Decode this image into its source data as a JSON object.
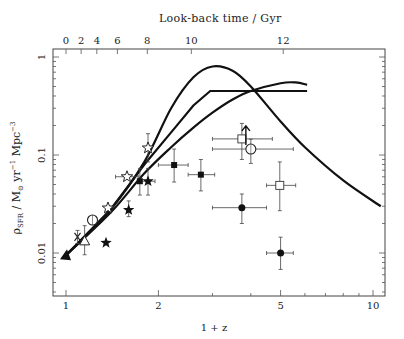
{
  "chart_data": {
    "type": "scatter",
    "title": "",
    "xlabel": "1 + z",
    "ylabel": "ρ_SFR / M⊙ yr⁻¹ Mpc⁻³",
    "x_scale": "log",
    "y_scale": "log",
    "xlim": [
      0.96,
      10.6
    ],
    "ylim": [
      0.0035,
      1.2
    ],
    "x_ticks": [
      1,
      2,
      5,
      10
    ],
    "x_tick_labels": [
      "1",
      "2",
      "5",
      "10"
    ],
    "y_ticks": [
      0.01,
      0.1,
      1
    ],
    "y_tick_labels": [
      "0.01",
      "0.1",
      "1"
    ],
    "top_axis": {
      "label": "Look-back time / Gyr",
      "ticks": [
        0,
        2,
        4,
        6,
        8,
        10,
        12
      ],
      "tick_labels": [
        "0",
        "2",
        "4",
        "6",
        "8",
        "10",
        "12"
      ],
      "tick_positions_1pz": [
        1.0,
        1.12,
        1.26,
        1.47,
        1.84,
        2.56,
        5.1
      ]
    },
    "grid": false,
    "legend": null,
    "series": [
      {
        "name": "filled-triangle",
        "marker": "filled-triangle",
        "points": [
          {
            "x": 1.0,
            "y": 0.0095
          }
        ]
      },
      {
        "name": "cross",
        "marker": "x-cross",
        "points": [
          {
            "x": 1.09,
            "y": 0.0146,
            "yerr": [
              0.0125,
              0.017
            ]
          }
        ]
      },
      {
        "name": "open-triangle",
        "marker": "open-triangle",
        "points": [
          {
            "x": 1.15,
            "y": 0.0133,
            "yerr": [
              0.0096,
              0.019
            ]
          }
        ]
      },
      {
        "name": "open-circle-low",
        "marker": "open-circle",
        "points": [
          {
            "x": 1.22,
            "y": 0.0217
          }
        ]
      },
      {
        "name": "filled-stars",
        "marker": "filled-star",
        "points": [
          {
            "x": 1.35,
            "y": 0.0127
          },
          {
            "x": 1.6,
            "y": 0.0275,
            "yerr": [
              0.0235,
              0.034
            ]
          },
          {
            "x": 1.85,
            "y": 0.054,
            "yerr": [
              0.039,
              0.073
            ],
            "xerr": [
              1.75,
              1.95
            ]
          }
        ]
      },
      {
        "name": "open-stars",
        "marker": "open-star",
        "points": [
          {
            "x": 1.37,
            "y": 0.0288
          },
          {
            "x": 1.58,
            "y": 0.06,
            "xerr": [
              1.45,
              1.72
            ]
          },
          {
            "x": 1.85,
            "y": 0.118,
            "yerr": [
              0.085,
              0.165
            ]
          }
        ]
      },
      {
        "name": "filled-squares",
        "marker": "filled-square",
        "points": [
          {
            "x": 1.74,
            "y": 0.054,
            "yerr": [
              0.039,
              0.073
            ]
          },
          {
            "x": 2.25,
            "y": 0.079,
            "yerr": [
              0.053,
              0.115
            ],
            "xerr": [
              2.0,
              2.5
            ]
          },
          {
            "x": 2.75,
            "y": 0.063,
            "yerr": [
              0.043,
              0.09
            ],
            "xerr": [
              2.5,
              3.05
            ]
          }
        ]
      },
      {
        "name": "open-squares",
        "marker": "open-square",
        "points": [
          {
            "x": 3.74,
            "y": 0.146,
            "yerr": [
              0.09,
              0.21
            ],
            "xerr": [
              3.0,
              4.7
            ],
            "lower_limit": true
          },
          {
            "x": 4.97,
            "y": 0.049,
            "yerr": [
              0.027,
              0.085
            ],
            "xerr": [
              4.5,
              5.6
            ]
          }
        ]
      },
      {
        "name": "open-circle-high",
        "marker": "open-circle",
        "points": [
          {
            "x": 4.0,
            "y": 0.115,
            "yerr": [
              0.082,
              0.145
            ],
            "xerr": [
              3.0,
              5.5
            ]
          }
        ]
      },
      {
        "name": "filled-circles",
        "marker": "filled-circle",
        "points": [
          {
            "x": 3.74,
            "y": 0.029,
            "yerr": [
              0.02,
              0.04
            ],
            "xerr": [
              3.0,
              4.5
            ]
          },
          {
            "x": 5.0,
            "y": 0.01,
            "yerr": [
              0.0068,
              0.0145
            ],
            "xerr": [
              4.5,
              5.5
            ]
          }
        ]
      }
    ],
    "curves": [
      {
        "name": "peaked-model",
        "x": [
          1.0,
          1.4,
          1.8,
          2.2,
          2.6,
          3.0,
          3.5,
          4.0,
          5.0,
          6.0,
          8.0,
          10.6
        ],
        "y": [
          0.0095,
          0.028,
          0.085,
          0.3,
          0.62,
          0.8,
          0.72,
          0.5,
          0.22,
          0.12,
          0.055,
          0.03
        ]
      },
      {
        "name": "flat-model",
        "x": [
          1.0,
          1.4,
          1.8,
          2.2,
          2.6,
          2.95,
          4.0,
          5.0,
          6.1
        ],
        "y": [
          0.0095,
          0.028,
          0.08,
          0.17,
          0.32,
          0.45,
          0.45,
          0.45,
          0.45
        ]
      },
      {
        "name": "rising-model",
        "x": [
          1.0,
          1.4,
          1.8,
          2.2,
          2.6,
          3.0,
          3.5,
          4.0,
          5.0,
          5.6,
          6.1
        ],
        "y": [
          0.0095,
          0.026,
          0.065,
          0.12,
          0.19,
          0.27,
          0.37,
          0.45,
          0.54,
          0.55,
          0.52
        ]
      }
    ]
  },
  "labels": {
    "top_title": "Look-back time / Gyr",
    "bottom_title": "1 + z",
    "ylabel_rho": "ρ",
    "ylabel_sub": "SFR",
    "ylabel_rest1": " / M",
    "ylabel_sun": "⊙",
    "ylabel_rest2": " yr",
    "ylabel_sup1": "−1",
    "ylabel_rest3": " Mpc",
    "ylabel_sup2": "−3"
  }
}
